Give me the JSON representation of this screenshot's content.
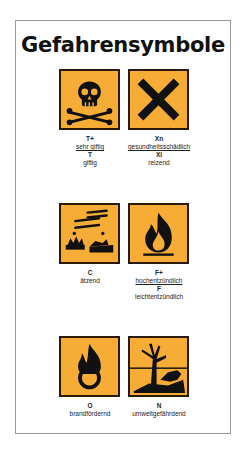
{
  "title": "Gefahrensymbole",
  "colors": {
    "pictogram_bg": "#f7ac36",
    "pictogram_border": "#2a1a0a",
    "frame": "#9a9a9a"
  },
  "symbols": [
    {
      "icon": "skull-crossbones-icon",
      "labels": [
        {
          "code": "T+",
          "text": "sehr giftig"
        },
        {
          "code": "T",
          "text": "giftig"
        }
      ]
    },
    {
      "icon": "x-cross-icon",
      "labels": [
        {
          "code": "Xn",
          "text": "gesundheitsschädlich"
        },
        {
          "code": "Xi",
          "text": "reizend"
        }
      ]
    },
    {
      "icon": "corrosive-icon",
      "labels": [
        {
          "code": "C",
          "text": "ätzend"
        }
      ]
    },
    {
      "icon": "flame-icon",
      "labels": [
        {
          "code": "F+",
          "text": "hochentzündlich"
        },
        {
          "code": "F",
          "text": "leichtentzündlich"
        }
      ]
    },
    {
      "icon": "flame-over-circle-icon",
      "labels": [
        {
          "code": "O",
          "text": "brandfördernd"
        }
      ]
    },
    {
      "icon": "dead-tree-fish-icon",
      "labels": [
        {
          "code": "N",
          "text": "umweltgefährdend"
        }
      ]
    }
  ]
}
